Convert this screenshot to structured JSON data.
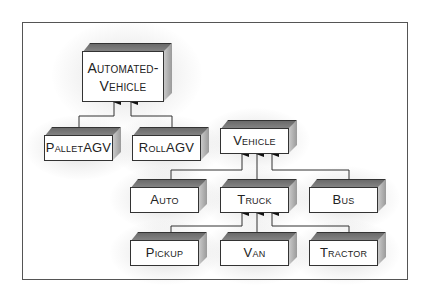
{
  "diagram": {
    "type": "class-hierarchy",
    "style": "hand-drawn 3D boxes with arrows pointing to parent class",
    "nodes": [
      {
        "id": "automated_vehicle",
        "label": "Automated-\nVehicle",
        "line1": "Automated-",
        "line2": "Vehicle"
      },
      {
        "id": "pallet_agv",
        "label": "PalletAGV"
      },
      {
        "id": "roll_agv",
        "label": "RollAGV"
      },
      {
        "id": "vehicle",
        "label": "Vehicle"
      },
      {
        "id": "auto",
        "label": "Auto"
      },
      {
        "id": "truck",
        "label": "Truck"
      },
      {
        "id": "bus",
        "label": "Bus"
      },
      {
        "id": "pickup",
        "label": "Pickup"
      },
      {
        "id": "van",
        "label": "Van"
      },
      {
        "id": "tractor",
        "label": "Tractor"
      }
    ],
    "edges": [
      {
        "from": "pallet_agv",
        "to": "automated_vehicle"
      },
      {
        "from": "roll_agv",
        "to": "automated_vehicle"
      },
      {
        "from": "auto",
        "to": "vehicle"
      },
      {
        "from": "truck",
        "to": "vehicle"
      },
      {
        "from": "bus",
        "to": "vehicle"
      },
      {
        "from": "pickup",
        "to": "truck"
      },
      {
        "from": "van",
        "to": "truck"
      },
      {
        "from": "tractor",
        "to": "truck"
      }
    ]
  },
  "labels": {
    "automated_vehicle_1": "Automated-",
    "automated_vehicle_2": "Vehicle",
    "pallet_agv": "PalletAGV",
    "roll_agv": "RollAGV",
    "vehicle": "Vehicle",
    "auto": "Auto",
    "truck": "Truck",
    "bus": "Bus",
    "pickup": "Pickup",
    "van": "Van",
    "tractor": "Tractor"
  }
}
